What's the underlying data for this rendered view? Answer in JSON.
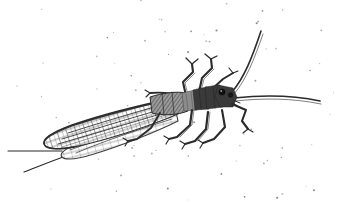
{
  "artwork": {
    "title": "Stonefly insect ink engraving",
    "subject": "stonefly",
    "style": "pen-and-ink hand-drawn engraving with stipple shading",
    "orientation": "diagonal, head upper-right, folded wings lower-left",
    "canvas": {
      "width": 341,
      "height": 203
    },
    "palette": {
      "background": "#ffffff",
      "ink_dark": "#2b2b2b",
      "ink_body": "#3a3a3a",
      "ink_mid": "#8c8c8c",
      "ink_soft": "#5c5c5c",
      "stipple": "#6d6d6d"
    },
    "parts": {
      "head": "head-and-eyes",
      "thorax": "segmented-thorax",
      "abdomen": "abdomen",
      "wings": "folded-forewing-and-hindwing",
      "antennae": "paired-long-antennae",
      "legs": "six-jointed-legs",
      "cercus_line": "long-trailing-line"
    },
    "counts": {
      "antennae": 2,
      "legs": 6,
      "wings": 2,
      "wing_vein_rows": 4,
      "stipple_dots": 190
    }
  },
  "geometry": {
    "antenna_upper": "M232,92 C244,78 252,58 261,31",
    "antenna_upper_shade": "M233,94 C245,80 253,60 262,33",
    "antenna_lower": "M234,98 C262,95 292,95 320,101",
    "antenna_lower_shade": "M234,100 C262,97 292,97 321,103",
    "head_outline": "M218,86 L233,89 L236,97 L233,106 L221,106 L215,98 Z",
    "eye_left": {
      "cx": 222,
      "cy": 92,
      "r": 3.1
    },
    "eye_right": {
      "cx": 230,
      "cy": 95,
      "r": 2.3
    },
    "thorax_seg1": "M205,88 L220,86 L223,106 L207,108 Z",
    "thorax_seg2": "M193,90 L206,88 L208,108 L195,109 Z",
    "thorax_seg3": "M182,93 L194,90 L196,109 L184,110 Z",
    "abdomen": "M150,98 C162,94 178,92 184,94 L187,110 C178,114 162,115 152,112 Z",
    "forewing": "M178,98 C150,104 104,115 72,126 C56,132 44,138 44,143 C45,149 58,150 74,147 C108,140 156,124 180,113 Z",
    "hindwing": "M176,112 C148,120 108,132 82,142 C68,147 60,152 62,156 C65,160 78,159 94,154 C124,145 160,130 178,121 Z",
    "wing_ribs": [
      "M176,101 C146,109 106,121 70,133",
      "M177,105 C148,113 108,125 68,138",
      "M178,109 C150,117 110,129 66,143",
      "M175,114 C146,122 106,134 74,147",
      "M172,118 C144,127 104,139 80,150"
    ],
    "leg_upper_1": "M186,96 L183,82 L193,72 L192,64",
    "leg_upper_1_tarsus": "M192,64 L187,59 M192,64 L197,60",
    "leg_upper_2": "M199,92 L202,78 L212,68 L211,60",
    "leg_upper_2_tarsus": "M211,60 L206,56 M211,60 L216,57",
    "leg_upper_3": "M212,90 L222,80 L232,74",
    "leg_upper_3_tarsus": "M232,74 L228,70 M232,74 L237,72",
    "leg_mid_right": "M232,104 L245,110 L242,120 L247,128",
    "leg_mid_right_tarsus": "M247,128 L243,133 M247,128 L252,131",
    "leg_lower_1": "M192,110 L190,124 L178,136 L170,138",
    "leg_lower_1_tarsus": "M170,138 L165,135 M170,138 L167,143",
    "leg_lower_2": "M208,112 L206,128 L196,140 L186,143",
    "leg_lower_2_tarsus": "M186,143 L181,141 M186,143 L183,148",
    "leg_lower_3": "M222,110 L224,126 L214,138 L204,142",
    "leg_lower_3_tarsus": "M204,142 L199,140 M204,142 L201,147",
    "hind_leg_left": "M160,113 L150,128 L136,139 L128,141",
    "hind_leg_left_tarsus": "M128,141 L123,138 M128,141 L125,146",
    "cercus_line": "M62,151 C46,151 26,151 8,151",
    "cercus_line_lower": "M66,156 C54,160 40,166 24,172",
    "thorax_spur": "M182,96 C172,93 160,92 152,93"
  },
  "stipple_field": {
    "description": "scattered gray dots, denser near thorax and around body, sparse at corners",
    "seed": 1847,
    "count": 190,
    "radius_min": 0.45,
    "radius_max": 1.1
  }
}
